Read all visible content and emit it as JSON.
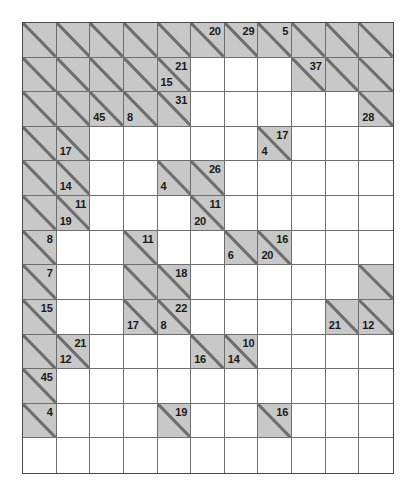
{
  "puzzle": {
    "type": "kakuro",
    "columns": 11,
    "rows": 13,
    "colors": {
      "block_fill": "#c8c8c8",
      "white_fill": "#ffffff",
      "grid_line": "#6e6e6e",
      "border": "#4a4a4a",
      "clue_text": "#1a1a1a",
      "page_background": "#ffffff"
    },
    "cells": [
      [
        {
          "t": "block"
        },
        {
          "t": "block"
        },
        {
          "t": "block"
        },
        {
          "t": "block"
        },
        {
          "t": "block"
        },
        {
          "t": "block",
          "down": "20"
        },
        {
          "t": "block",
          "down": "29"
        },
        {
          "t": "block",
          "down": "5"
        },
        {
          "t": "block"
        },
        {
          "t": "block"
        },
        {
          "t": "block"
        }
      ],
      [
        {
          "t": "block"
        },
        {
          "t": "block"
        },
        {
          "t": "block"
        },
        {
          "t": "block"
        },
        {
          "t": "block",
          "across": "15",
          "down": "21"
        },
        {
          "t": "white"
        },
        {
          "t": "white"
        },
        {
          "t": "white"
        },
        {
          "t": "block",
          "down": "37"
        },
        {
          "t": "block"
        },
        {
          "t": "block"
        }
      ],
      [
        {
          "t": "block"
        },
        {
          "t": "block"
        },
        {
          "t": "block",
          "across": "45"
        },
        {
          "t": "block",
          "across": "8"
        },
        {
          "t": "block",
          "down": "31"
        },
        {
          "t": "white"
        },
        {
          "t": "white"
        },
        {
          "t": "white"
        },
        {
          "t": "white"
        },
        {
          "t": "white"
        },
        {
          "t": "block",
          "across": "28"
        }
      ],
      [
        {
          "t": "block"
        },
        {
          "t": "block",
          "across": "17"
        },
        {
          "t": "white"
        },
        {
          "t": "white"
        },
        {
          "t": "white"
        },
        {
          "t": "white"
        },
        {
          "t": "white"
        },
        {
          "t": "block",
          "across": "4",
          "down": "17"
        },
        {
          "t": "white"
        },
        {
          "t": "white"
        },
        {
          "t": "white"
        }
      ],
      [
        {
          "t": "block"
        },
        {
          "t": "block",
          "across": "14"
        },
        {
          "t": "white"
        },
        {
          "t": "white"
        },
        {
          "t": "block",
          "across": "4"
        },
        {
          "t": "block",
          "down": "26"
        },
        {
          "t": "white"
        },
        {
          "t": "white"
        },
        {
          "t": "white"
        },
        {
          "t": "white"
        },
        {
          "t": "white"
        }
      ],
      [
        {
          "t": "block"
        },
        {
          "t": "block",
          "across": "19",
          "down": "11"
        },
        {
          "t": "white"
        },
        {
          "t": "white"
        },
        {
          "t": "white"
        },
        {
          "t": "block",
          "across": "20",
          "down": "11"
        },
        {
          "t": "white"
        },
        {
          "t": "white"
        },
        {
          "t": "white"
        },
        {
          "t": "white"
        },
        {
          "t": "white"
        }
      ],
      [
        {
          "t": "block",
          "down": "8"
        },
        {
          "t": "white"
        },
        {
          "t": "white"
        },
        {
          "t": "block",
          "down": "11"
        },
        {
          "t": "white"
        },
        {
          "t": "white"
        },
        {
          "t": "block",
          "across": "6"
        },
        {
          "t": "block",
          "across": "20",
          "down": "16"
        },
        {
          "t": "white"
        },
        {
          "t": "white"
        },
        {
          "t": "white"
        }
      ],
      [
        {
          "t": "block",
          "down": "7"
        },
        {
          "t": "white"
        },
        {
          "t": "white"
        },
        {
          "t": "block"
        },
        {
          "t": "block",
          "down": "18"
        },
        {
          "t": "white"
        },
        {
          "t": "white"
        },
        {
          "t": "white"
        },
        {
          "t": "white"
        },
        {
          "t": "white"
        },
        {
          "t": "block"
        }
      ],
      [
        {
          "t": "block",
          "down": "15"
        },
        {
          "t": "white"
        },
        {
          "t": "white"
        },
        {
          "t": "block",
          "across": "17"
        },
        {
          "t": "block",
          "across": "8",
          "down": "22"
        },
        {
          "t": "white"
        },
        {
          "t": "white"
        },
        {
          "t": "white"
        },
        {
          "t": "white"
        },
        {
          "t": "block",
          "across": "21"
        },
        {
          "t": "block",
          "across": "12"
        }
      ],
      [
        {
          "t": "block"
        },
        {
          "t": "block",
          "across": "12",
          "down": "21"
        },
        {
          "t": "white"
        },
        {
          "t": "white"
        },
        {
          "t": "white"
        },
        {
          "t": "block",
          "across": "16"
        },
        {
          "t": "block",
          "across": "14",
          "down": "10"
        },
        {
          "t": "white"
        },
        {
          "t": "white"
        },
        {
          "t": "white"
        },
        {
          "t": "white"
        }
      ],
      [
        {
          "t": "block",
          "down": "45"
        },
        {
          "t": "white"
        },
        {
          "t": "white"
        },
        {
          "t": "white"
        },
        {
          "t": "white"
        },
        {
          "t": "white"
        },
        {
          "t": "white"
        },
        {
          "t": "white"
        },
        {
          "t": "white"
        },
        {
          "t": "white"
        },
        {
          "t": "white"
        }
      ],
      [
        {
          "t": "block",
          "down": "4"
        },
        {
          "t": "white"
        },
        {
          "t": "white"
        },
        {
          "t": "white"
        },
        {
          "t": "block",
          "down": "19"
        },
        {
          "t": "white"
        },
        {
          "t": "white"
        },
        {
          "t": "block",
          "down": "16"
        },
        {
          "t": "white"
        },
        {
          "t": "white"
        },
        {
          "t": "white"
        }
      ],
      [
        {
          "t": "white"
        },
        {
          "t": "white"
        },
        {
          "t": "white"
        },
        {
          "t": "white"
        },
        {
          "t": "white"
        },
        {
          "t": "white"
        },
        {
          "t": "white"
        },
        {
          "t": "white"
        },
        {
          "t": "white"
        },
        {
          "t": "white"
        },
        {
          "t": "white"
        }
      ]
    ]
  }
}
